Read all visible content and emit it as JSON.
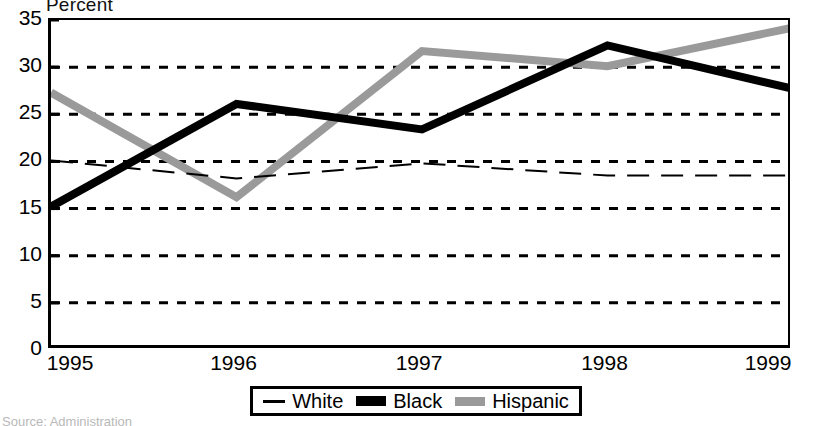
{
  "axis_label": "Percent",
  "source_note": "Source: Administration",
  "legend": {
    "items": [
      {
        "label": "White",
        "marker": "dashed-line",
        "color": "#000000"
      },
      {
        "label": "Black",
        "marker": "thick-solid-line",
        "color": "#000000"
      },
      {
        "label": "Hispanic",
        "marker": "thick-solid-line",
        "color": "#9a9a9a"
      }
    ]
  },
  "chart_data": {
    "type": "line",
    "title": "",
    "subtitle": "",
    "xlabel": "",
    "ylabel": "Percent",
    "categories": [
      "1995",
      "1996",
      "1997",
      "1998",
      "1999"
    ],
    "x": [
      1995,
      1996,
      1997,
      1998,
      1999
    ],
    "xlim": [
      1995,
      1999
    ],
    "ylim": [
      0,
      35
    ],
    "yticks": [
      0,
      5,
      10,
      15,
      20,
      25,
      30,
      35
    ],
    "xticks": [
      "1995",
      "1996",
      "1997",
      "1998",
      "1999"
    ],
    "grid": "horizontal-dashed",
    "legend_position": "bottom-center",
    "series": [
      {
        "name": "White",
        "style": "dashed",
        "width": 2,
        "color": "#000000",
        "values": [
          20.1,
          18.2,
          19.8,
          18.5,
          18.5
        ]
      },
      {
        "name": "Black",
        "style": "solid",
        "width": 8,
        "color": "#000000",
        "values": [
          15.2,
          26.1,
          23.4,
          32.3,
          27.7
        ]
      },
      {
        "name": "Hispanic",
        "style": "solid",
        "width": 8,
        "color": "#9a9a9a",
        "values": [
          27.3,
          16.2,
          31.7,
          30.1,
          34.2
        ]
      }
    ]
  }
}
